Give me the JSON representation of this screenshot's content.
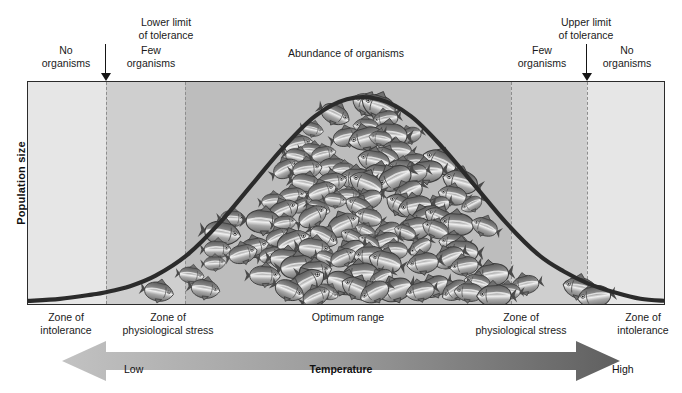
{
  "figure": {
    "y_axis_label": "Population size",
    "x_axis_label": "Temperature",
    "x_low_label": "Low",
    "x_high_label": "High"
  },
  "top_annotations": {
    "lower_limit": "Lower limit\nof tolerance",
    "lower_limit_line1": "Lower limit",
    "lower_limit_line2": "of tolerance",
    "upper_limit_line1": "Upper limit",
    "upper_limit_line2": "of tolerance",
    "no_organisms_left_line1": "No",
    "no_organisms_left_line2": "organisms",
    "few_organisms_left_line1": "Few",
    "few_organisms_left_line2": "organisms",
    "abundance": "Abundance of organisms",
    "few_organisms_right_line1": "Few",
    "few_organisms_right_line2": "organisms",
    "no_organisms_right_line1": "No",
    "no_organisms_right_line2": "organisms"
  },
  "bottom_zone_labels": {
    "intolerance_left_line1": "Zone of",
    "intolerance_left_line2": "intolerance",
    "stress_left_line1": "Zone of",
    "stress_left_line2": "physiological stress",
    "optimum": "Optimum range",
    "stress_right_line1": "Zone of",
    "stress_right_line2": "physiological stress",
    "intolerance_right_line1": "Zone of",
    "intolerance_right_line2": "intolerance"
  },
  "colors": {
    "zone_intolerance": "#e6e6e6",
    "zone_stress": "#cfcfcf",
    "zone_optimum": "#bdbdbd",
    "curve": "#2b2b2b",
    "frame": "#2b2b2b",
    "divider": "#8d8d8d",
    "arrow_light": "#b8b8b8",
    "arrow_dark": "#6a6a6a",
    "text": "#1a1a1a"
  },
  "chart_data": {
    "type": "line",
    "title": "",
    "xlabel": "Temperature",
    "ylabel": "Population size",
    "grid": false,
    "legend_position": "none",
    "x_tick_labels": [
      "Low",
      "High"
    ],
    "xlim": [
      0,
      100
    ],
    "ylim": [
      0,
      100
    ],
    "curve_name": "Population size vs temperature (normal distribution)",
    "x": [
      0,
      5,
      10,
      12,
      16,
      20,
      25,
      30,
      35,
      40,
      45,
      50,
      55,
      60,
      65,
      70,
      75,
      80,
      84,
      88,
      92,
      96,
      100
    ],
    "y": [
      1,
      2,
      4,
      5,
      8,
      13,
      23,
      38,
      56,
      74,
      89,
      97,
      97,
      89,
      74,
      56,
      38,
      23,
      15,
      9,
      5,
      2,
      1
    ],
    "zones": [
      {
        "name": "Zone of intolerance",
        "x_start": 0,
        "x_end": 12.2,
        "shade": "#e6e6e6",
        "organisms": "No organisms"
      },
      {
        "name": "Zone of physiological stress",
        "x_start": 12.2,
        "x_end": 24.6,
        "shade": "#cfcfcf",
        "organisms": "Few organisms"
      },
      {
        "name": "Optimum range",
        "x_start": 24.6,
        "x_end": 75.7,
        "shade": "#bdbdbd",
        "organisms": "Abundance of organisms"
      },
      {
        "name": "Zone of physiological stress",
        "x_start": 75.7,
        "x_end": 87.6,
        "shade": "#cfcfcf",
        "organisms": "Few organisms"
      },
      {
        "name": "Zone of intolerance",
        "x_start": 87.6,
        "x_end": 100,
        "shade": "#e6e6e6",
        "organisms": "No organisms"
      }
    ],
    "annotations": [
      {
        "label": "Lower limit of tolerance",
        "x": 12.2,
        "type": "arrow-down"
      },
      {
        "label": "Upper limit of tolerance",
        "x": 87.6,
        "type": "arrow-down"
      }
    ]
  }
}
